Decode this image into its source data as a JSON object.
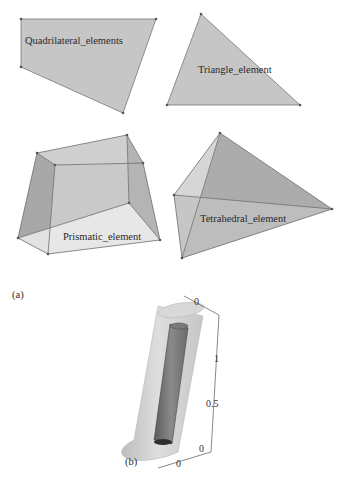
{
  "panel_a": {
    "label": "(a)",
    "shapes": [
      {
        "name": "quadrilateral",
        "label": "Quadrilateral_elements"
      },
      {
        "name": "triangle",
        "label": "Triangle_element"
      },
      {
        "name": "prism",
        "label": "Prismatic_element"
      },
      {
        "name": "tetrahedron",
        "label": "Tetrahedral_element"
      }
    ]
  },
  "panel_b": {
    "label": "(b)",
    "axis_ticks": {
      "vertical_top": "0",
      "vertical_mid_1": "1",
      "vertical_mid_05": "0.5",
      "vertical_bottom": "0",
      "horizontal_bottom": "0"
    }
  },
  "colors": {
    "face_gray": "#c4c4c4",
    "face_dark": "#a9a9a9",
    "face_light": "#e4e4e4",
    "edge": "#6e6e6e",
    "vertex": "#555555"
  }
}
